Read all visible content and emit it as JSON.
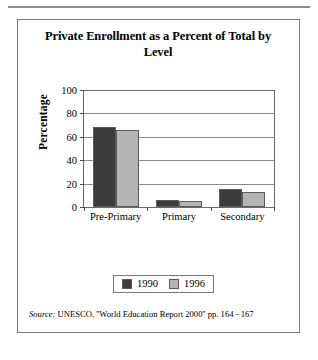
{
  "chart_data": {
    "type": "bar",
    "title": "Private Enrollment as a Percent of Total by Level",
    "xlabel": "",
    "ylabel": "Percentage",
    "categories": [
      "Pre-Primary",
      "Primary",
      "Secondary"
    ],
    "series": [
      {
        "name": "1990",
        "color": "#3b3b3b",
        "values": [
          68,
          6,
          15
        ]
      },
      {
        "name": "1996",
        "color": "#b4b4b4",
        "values": [
          66,
          5,
          13
        ]
      }
    ],
    "ylim": [
      0,
      100
    ],
    "yticks": [
      0,
      20,
      40,
      60,
      80,
      100
    ],
    "ytick_labels": [
      "0",
      "20",
      "40",
      "60",
      "80",
      "100"
    ],
    "grid": true,
    "legend_position": "bottom"
  },
  "figure": {
    "title": "Private Enrollment as a Percent of Total by Level",
    "axis_label_y": "Percentage",
    "legend": [
      {
        "label": "1990",
        "color": "#3b3b3b"
      },
      {
        "label": "1996",
        "color": "#b4b4b4"
      }
    ],
    "source": {
      "prefix": "Source:",
      "text": "UNESCO, ''World Education Report 2000'' pp. 164 - 167"
    }
  }
}
